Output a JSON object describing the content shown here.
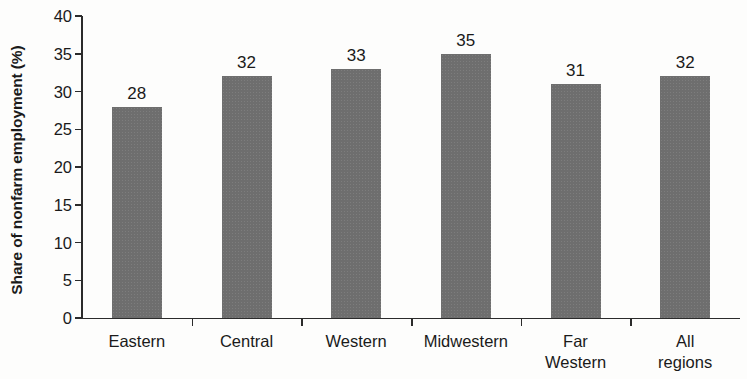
{
  "chart_data": {
    "type": "bar",
    "title": "",
    "xlabel": "",
    "ylabel": "Share of nonfarm employment (%)",
    "categories": [
      "Eastern",
      "Central",
      "Western",
      "Midwestern",
      "Far\nWestern",
      "All regions"
    ],
    "values": [
      28,
      32,
      33,
      35,
      31,
      32
    ],
    "value_labels": [
      "28",
      "32",
      "33",
      "35",
      "31",
      "32"
    ],
    "ylim": [
      0,
      40
    ],
    "yticks": [
      0,
      5,
      10,
      15,
      20,
      25,
      30,
      35,
      40
    ],
    "ytick_labels": [
      "0",
      "5",
      "10",
      "15",
      "20",
      "25",
      "30",
      "35",
      "40"
    ],
    "grid": false,
    "legend": false,
    "bar_color": "#6e6e6e",
    "axis_color": "#2b2b2b",
    "background_color": "#fdfdfc"
  }
}
